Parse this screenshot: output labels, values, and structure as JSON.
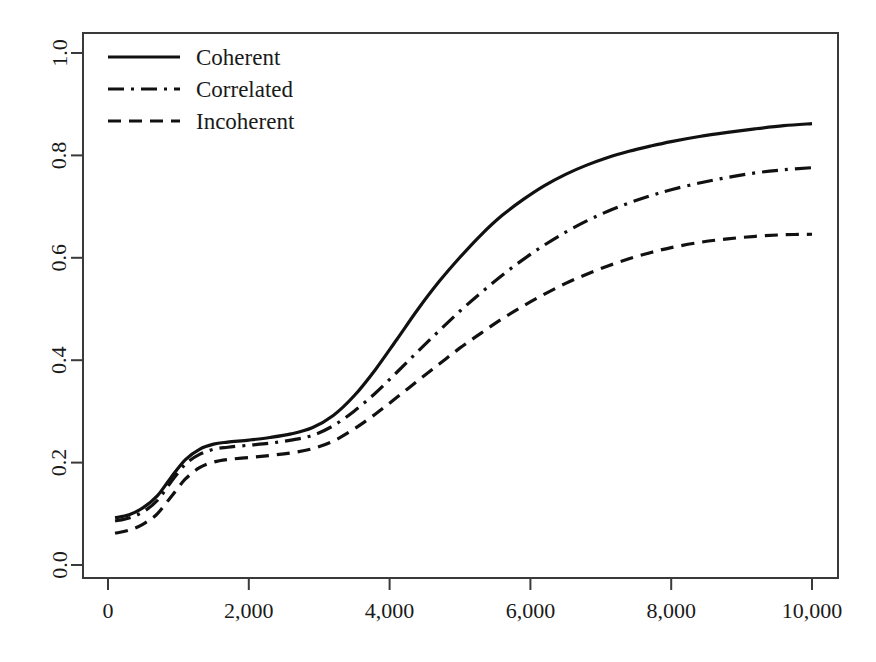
{
  "chart_data": {
    "type": "line",
    "title": "",
    "subtitle": "",
    "xlabel": "",
    "ylabel": "",
    "xlim": [
      0,
      10400
    ],
    "ylim": [
      0,
      1.04
    ],
    "grid": false,
    "legend_position": "top-left",
    "x_ticks": [
      0,
      2000,
      4000,
      6000,
      8000,
      10000
    ],
    "x_tick_labels": [
      "0",
      "2,000",
      "4,000",
      "6,000",
      "8,000",
      "10,000"
    ],
    "y_ticks": [
      0.0,
      0.2,
      0.4,
      0.6,
      0.8,
      1.0
    ],
    "y_tick_labels": [
      "0.0",
      "0.2",
      "0.4",
      "0.6",
      "0.8",
      "1.0"
    ],
    "x": [
      100,
      300,
      500,
      700,
      900,
      1100,
      1300,
      1500,
      1700,
      2000,
      2300,
      2600,
      2900,
      3200,
      3500,
      3800,
      4100,
      4400,
      4700,
      5000,
      5300,
      5600,
      5900,
      6200,
      6500,
      6800,
      7100,
      7400,
      7700,
      8000,
      8400,
      8800,
      9200,
      9600,
      10000
    ],
    "series": [
      {
        "name": "Coherent",
        "style": "solid",
        "values": [
          0.092,
          0.098,
          0.112,
          0.135,
          0.172,
          0.206,
          0.226,
          0.236,
          0.24,
          0.244,
          0.249,
          0.256,
          0.268,
          0.292,
          0.331,
          0.382,
          0.44,
          0.499,
          0.553,
          0.601,
          0.645,
          0.683,
          0.714,
          0.741,
          0.763,
          0.781,
          0.796,
          0.808,
          0.818,
          0.827,
          0.837,
          0.845,
          0.852,
          0.858,
          0.862
        ]
      },
      {
        "name": "Correlated",
        "style": "dash-dot",
        "values": [
          0.086,
          0.092,
          0.104,
          0.126,
          0.163,
          0.197,
          0.216,
          0.226,
          0.23,
          0.234,
          0.238,
          0.244,
          0.253,
          0.272,
          0.301,
          0.336,
          0.376,
          0.417,
          0.457,
          0.496,
          0.532,
          0.566,
          0.597,
          0.625,
          0.65,
          0.672,
          0.691,
          0.707,
          0.721,
          0.733,
          0.746,
          0.757,
          0.766,
          0.772,
          0.776
        ]
      },
      {
        "name": "Incoherent",
        "style": "dashed",
        "values": [
          0.062,
          0.068,
          0.08,
          0.1,
          0.134,
          0.168,
          0.19,
          0.201,
          0.206,
          0.21,
          0.214,
          0.219,
          0.227,
          0.242,
          0.266,
          0.295,
          0.327,
          0.36,
          0.392,
          0.424,
          0.453,
          0.481,
          0.506,
          0.529,
          0.55,
          0.568,
          0.584,
          0.598,
          0.61,
          0.62,
          0.63,
          0.637,
          0.642,
          0.645,
          0.646
        ]
      }
    ]
  },
  "legend": {
    "entries": [
      {
        "label": "Coherent",
        "style": "solid"
      },
      {
        "label": "Correlated",
        "style": "dash-dot"
      },
      {
        "label": "Incoherent",
        "style": "dashed"
      }
    ]
  },
  "colors": {
    "line": "#111111",
    "axis": "#3a3a3a",
    "background": "#ffffff",
    "text": "#1a1a1a"
  },
  "plot_box": {
    "left": 83,
    "right": 838,
    "top": 33,
    "bottom": 578
  }
}
